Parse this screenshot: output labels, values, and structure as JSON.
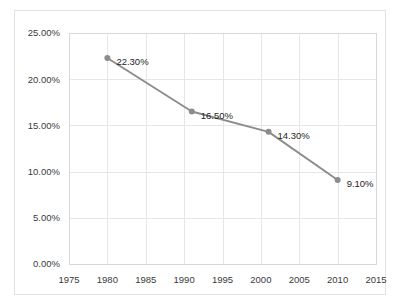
{
  "chart_data": {
    "type": "line",
    "title": "",
    "subtitle": "",
    "xlabel": "",
    "ylabel": "",
    "xlim": [
      1975,
      2015
    ],
    "ylim": [
      0,
      25
    ],
    "grid": true,
    "legend": false,
    "legend_position": "none",
    "x": [
      1980,
      1991,
      2001,
      2010
    ],
    "values": [
      22.3,
      16.5,
      14.3,
      9.1
    ],
    "point_labels": [
      "22.30%",
      "16.50%",
      "14.30%",
      "9.10%"
    ],
    "series": [
      {
        "name": "",
        "x": [
          1980,
          1991,
          2001,
          2010
        ],
        "values": [
          22.3,
          16.5,
          14.3,
          9.1
        ],
        "color": "#8c8c8c",
        "marker": "circle"
      }
    ],
    "xticks": [
      1975,
      1980,
      1985,
      1990,
      1995,
      2000,
      2005,
      2010,
      2015
    ],
    "xtick_labels": [
      "1975",
      "1980",
      "1985",
      "1990",
      "1995",
      "2000",
      "2005",
      "2010",
      "2015"
    ],
    "yticks": [
      0,
      5,
      10,
      15,
      20,
      25
    ],
    "ytick_labels": [
      "0.00%",
      "5.00%",
      "10.00%",
      "15.00%",
      "20.00%",
      "25.00%"
    ],
    "colors": {
      "line": "#8c8c8c",
      "marker": "#8c8c8c",
      "grid": "#e6e6e6",
      "frame": "#d8d8d8",
      "outer_border": "#e2e2e2",
      "tick_text": "#3a3a3a",
      "label_text": "#242424",
      "background": "#ffffff"
    }
  }
}
